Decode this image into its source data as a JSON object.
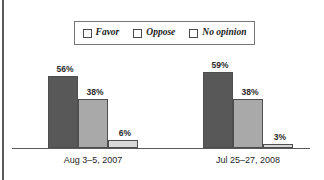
{
  "chart_data": {
    "type": "bar",
    "title": "",
    "subtitle": "",
    "xlabel": "",
    "ylabel": "",
    "ylim": [
      0,
      100
    ],
    "grid": false,
    "legend_position": "top-center",
    "categories": [
      "Aug 3–5, 2007",
      "Jul 25–27, 2008"
    ],
    "series": [
      {
        "name": "Favor",
        "values": [
          56,
          38
        ],
        "color": "#585858"
      },
      {
        "name": "Oppose",
        "values": [
          38,
          38
        ],
        "color": "#a9a9a9"
      },
      {
        "name": "No opinion",
        "values": [
          6,
          3
        ],
        "color": "#d9d9d9"
      }
    ],
    "value_labels": [
      [
        "56%",
        "38%",
        "6%"
      ],
      [
        "59%",
        "38%",
        "3%"
      ]
    ],
    "series_values_display": {
      "Favor": [
        56,
        59
      ],
      "Oppose": [
        38,
        38
      ],
      "No opinion": [
        6,
        3
      ]
    }
  },
  "legend": {
    "items": [
      {
        "label": "Favor",
        "color": "#585858"
      },
      {
        "label": "Oppose",
        "color": "#a9a9a9"
      },
      {
        "label": "No opinion",
        "color": "#d9d9d9"
      }
    ]
  },
  "groups": [
    {
      "category": "Aug 3–5, 2007",
      "bars": [
        {
          "series": "Favor",
          "value": 56,
          "label": "56%"
        },
        {
          "series": "Oppose",
          "value": 38,
          "label": "38%"
        },
        {
          "series": "No opinion",
          "value": 6,
          "label": "6%"
        }
      ]
    },
    {
      "category": "Jul 25–27, 2008",
      "bars": [
        {
          "series": "Favor",
          "value": 59,
          "label": "59%"
        },
        {
          "series": "Oppose",
          "value": 38,
          "label": "38%"
        },
        {
          "series": "No opinion",
          "value": 3,
          "label": "3%"
        }
      ]
    }
  ],
  "colors": {
    "favor": "#585858",
    "oppose": "#a9a9a9",
    "no_opinion": "#d9d9d9",
    "axis": "#595959",
    "text": "#1f1f1f"
  }
}
